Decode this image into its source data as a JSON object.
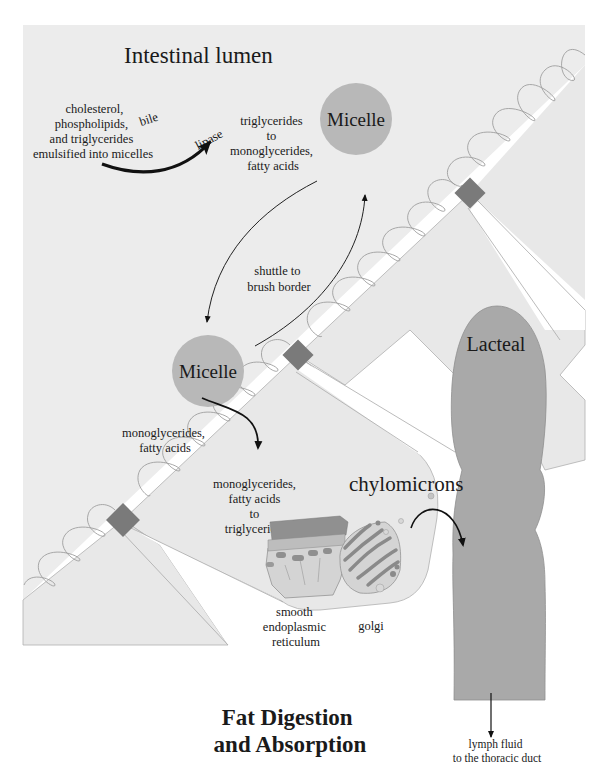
{
  "figure": {
    "title_line1": "Fat Digestion",
    "title_line2": "and Absorption",
    "caption": "Figure 6-7"
  },
  "regions": {
    "lumen_label": "Intestinal lumen",
    "lacteal_label": "Lacteal"
  },
  "labels": {
    "emulsify": [
      "cholesterol,",
      "phospholipids,",
      "and triglycerides",
      "emulsified into micelles"
    ],
    "bile": "bile",
    "lipase": "lipase",
    "hydrolysis": [
      "triglycerides",
      "to",
      "monoglycerides,",
      "fatty acids"
    ],
    "micelle_top": "Micelle",
    "micelle_bottom": "Micelle",
    "shuttle": [
      "shuttle to",
      "brush border"
    ],
    "absorbed": [
      "monoglycerides,",
      "fatty acids"
    ],
    "resynthesis": [
      "monoglycerides,",
      "fatty acids",
      "to",
      "triglycerides"
    ],
    "chylomicrons": "chylomicrons",
    "ser": [
      "smooth",
      "endoplasmic",
      "reticulum"
    ],
    "golgi": "golgi",
    "lymph": [
      "lymph fluid",
      "to the thoracic duct"
    ]
  },
  "colors": {
    "lumen_bg": "#ececec",
    "cell_bg": "#e9e9e9",
    "micelle": "#b8b8b8",
    "diamond": "#7a7a7a",
    "lacteal": "#a9a9a9",
    "outline": "#9a9a9a",
    "arrow": "#111111"
  }
}
